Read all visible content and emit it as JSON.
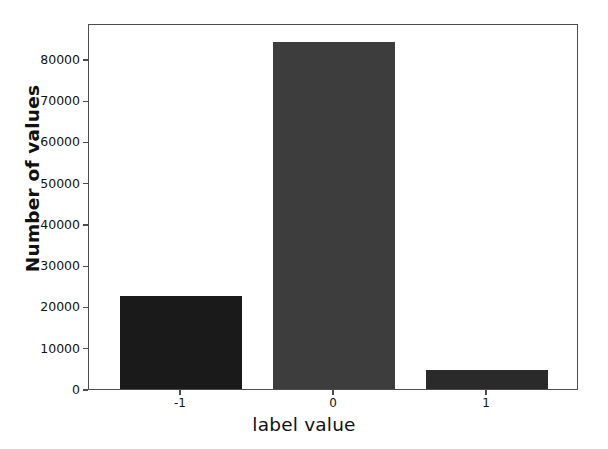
{
  "chart_data": {
    "type": "bar",
    "title": "",
    "xlabel": "label value",
    "ylabel": "Number of values",
    "categories": [
      "-1",
      "0",
      "1"
    ],
    "values": [
      22500,
      84000,
      4500
    ],
    "series": [
      {
        "name": "Number of values",
        "values": [
          22500,
          84000,
          4500
        ]
      }
    ],
    "bar_colors": [
      "#1a1a1a",
      "#3d3d3d",
      "#2a2a2a"
    ],
    "ylim": [
      0,
      88700
    ],
    "xlim": [
      -1.6,
      1.6
    ],
    "yticks": [
      0,
      10000,
      20000,
      30000,
      40000,
      50000,
      60000,
      70000,
      80000
    ],
    "ytick_labels": [
      "0",
      "10000",
      "20000",
      "30000",
      "40000",
      "50000",
      "60000",
      "70000",
      "80000"
    ],
    "xticks": [
      -1,
      0,
      1
    ],
    "xtick_labels": [
      "-1",
      "0",
      "1"
    ],
    "grid": false,
    "legend": null,
    "bar_width": 0.8,
    "annotations": []
  },
  "figure": {
    "background_color": "#ffffff",
    "axes_edge_color": "#4d4d4d",
    "tick_label_color": "#121212",
    "axis_title_color": "#111111"
  }
}
